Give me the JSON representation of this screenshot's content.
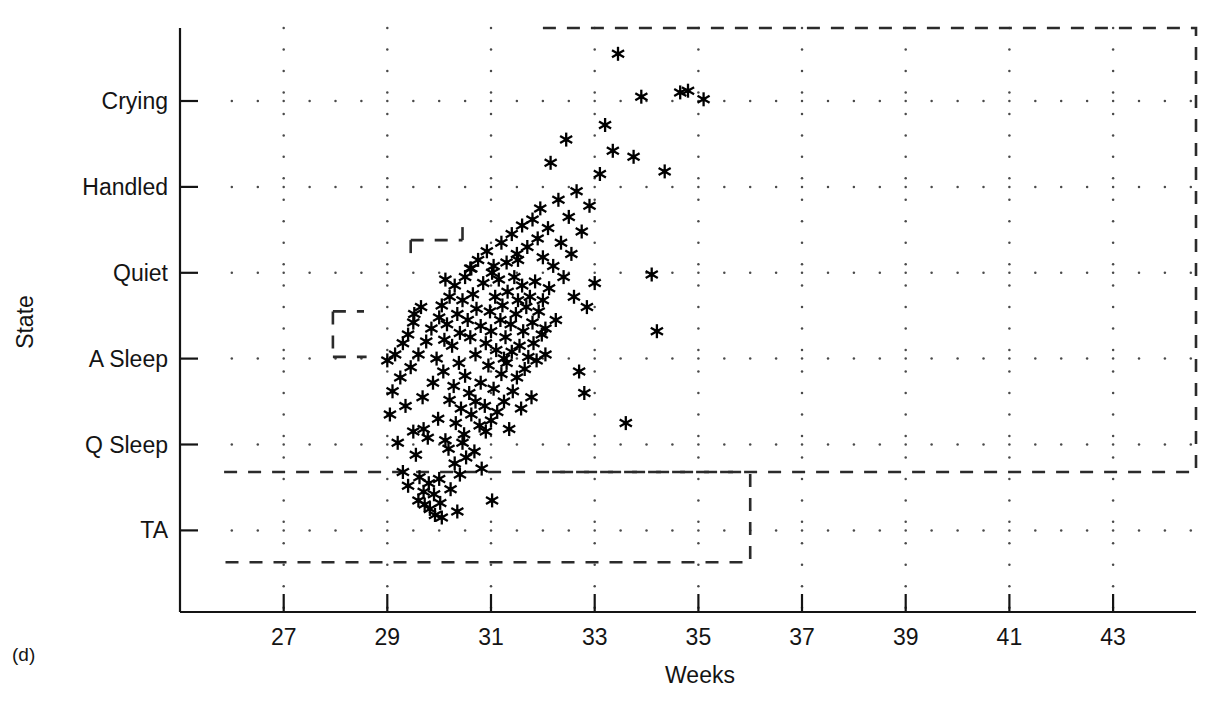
{
  "figure": {
    "panel_label": "(d)",
    "background_color": "#ffffff",
    "ink_color": "#141414"
  },
  "chart_data": {
    "type": "scatter",
    "title": "",
    "subtitle": "",
    "xlabel": "Weeks",
    "ylabel": "State",
    "xlim": [
      25,
      44.6
    ],
    "ylim": [
      -0.95,
      5.85
    ],
    "xticks": [
      27,
      29,
      31,
      33,
      35,
      37,
      39,
      41,
      43
    ],
    "xtick_labels": [
      "27",
      "29",
      "31",
      "33",
      "35",
      "37",
      "39",
      "41",
      "43"
    ],
    "yticks": [
      0,
      1,
      2,
      3,
      4,
      5
    ],
    "ytick_labels": [
      "TA",
      "Q Sleep",
      "A Sleep",
      "Quiet",
      "Handled",
      "Crying"
    ],
    "y_category_order_bottom_to_top": [
      "TA",
      "Q Sleep",
      "A Sleep",
      "Quiet",
      "Handled",
      "Crying"
    ],
    "grid": true,
    "grid_style": "dotted-lattice",
    "legend": null,
    "marker": "asterisk",
    "marker_color": "#000000",
    "points": [
      [
        29.05,
        1.35
      ],
      [
        29.1,
        1.62
      ],
      [
        29.15,
        2.05
      ],
      [
        29.2,
        1.02
      ],
      [
        29.25,
        1.78
      ],
      [
        29.3,
        2.18
      ],
      [
        29.3,
        0.68
      ],
      [
        29.35,
        1.45
      ],
      [
        29.4,
        2.28
      ],
      [
        29.4,
        0.52
      ],
      [
        29.45,
        1.9
      ],
      [
        29.5,
        2.42
      ],
      [
        29.5,
        1.15
      ],
      [
        29.55,
        0.88
      ],
      [
        29.6,
        2.05
      ],
      [
        29.6,
        0.35
      ],
      [
        29.62,
        0.62
      ],
      [
        29.65,
        2.6
      ],
      [
        29.68,
        1.55
      ],
      [
        29.7,
        0.45
      ],
      [
        29.72,
        0.3
      ],
      [
        29.75,
        2.2
      ],
      [
        29.78,
        1.08
      ],
      [
        29.8,
        0.55
      ],
      [
        29.82,
        0.25
      ],
      [
        29.85,
        2.35
      ],
      [
        29.88,
        1.72
      ],
      [
        29.9,
        0.42
      ],
      [
        29.92,
        0.18
      ],
      [
        29.95,
        2.0
      ],
      [
        29.98,
        1.3
      ],
      [
        30.0,
        2.48
      ],
      [
        30.0,
        0.6
      ],
      [
        30.02,
        0.32
      ],
      [
        30.05,
        2.62
      ],
      [
        30.08,
        1.85
      ],
      [
        30.1,
        2.22
      ],
      [
        30.12,
        1.05
      ],
      [
        30.15,
        2.4
      ],
      [
        30.18,
        0.95
      ],
      [
        30.2,
        2.72
      ],
      [
        30.2,
        1.52
      ],
      [
        30.22,
        0.48
      ],
      [
        30.25,
        2.15
      ],
      [
        30.28,
        1.68
      ],
      [
        30.3,
        2.85
      ],
      [
        30.3,
        0.78
      ],
      [
        30.32,
        1.25
      ],
      [
        30.35,
        2.52
      ],
      [
        30.38,
        1.95
      ],
      [
        30.4,
        2.3
      ],
      [
        30.4,
        0.65
      ],
      [
        30.42,
        1.42
      ],
      [
        30.45,
        2.68
      ],
      [
        30.48,
        1.12
      ],
      [
        30.5,
        2.95
      ],
      [
        30.5,
        1.8
      ],
      [
        30.52,
        0.85
      ],
      [
        30.55,
        2.45
      ],
      [
        30.58,
        1.6
      ],
      [
        30.6,
        3.05
      ],
      [
        30.6,
        2.25
      ],
      [
        30.62,
        1.35
      ],
      [
        30.65,
        2.75
      ],
      [
        30.68,
        0.92
      ],
      [
        30.7,
        2.05
      ],
      [
        30.7,
        1.5
      ],
      [
        30.72,
        2.58
      ],
      [
        30.75,
        3.15
      ],
      [
        30.78,
        1.22
      ],
      [
        30.8,
        2.38
      ],
      [
        30.8,
        1.72
      ],
      [
        30.82,
        0.72
      ],
      [
        30.85,
        2.88
      ],
      [
        30.88,
        1.45
      ],
      [
        30.9,
        2.18
      ],
      [
        30.92,
        3.25
      ],
      [
        30.95,
        1.92
      ],
      [
        30.98,
        2.55
      ],
      [
        31.0,
        1.28
      ],
      [
        31.0,
        2.32
      ],
      [
        31.02,
        3.0
      ],
      [
        31.05,
        1.65
      ],
      [
        31.08,
        2.72
      ],
      [
        31.1,
        2.1
      ],
      [
        31.12,
        1.38
      ],
      [
        31.15,
        2.92
      ],
      [
        31.18,
        2.45
      ],
      [
        31.2,
        3.35
      ],
      [
        31.2,
        1.82
      ],
      [
        31.22,
        2.62
      ],
      [
        31.25,
        1.5
      ],
      [
        31.28,
        2.25
      ],
      [
        31.3,
        3.12
      ],
      [
        31.3,
        1.95
      ],
      [
        31.32,
        2.78
      ],
      [
        31.35,
        1.18
      ],
      [
        31.38,
        2.4
      ],
      [
        31.4,
        3.45
      ],
      [
        31.4,
        2.08
      ],
      [
        31.42,
        1.62
      ],
      [
        31.45,
        2.95
      ],
      [
        31.48,
        2.52
      ],
      [
        31.5,
        3.22
      ],
      [
        31.5,
        1.78
      ],
      [
        31.52,
        2.68
      ],
      [
        31.55,
        2.15
      ],
      [
        31.58,
        1.42
      ],
      [
        31.6,
        3.55
      ],
      [
        31.6,
        2.85
      ],
      [
        31.62,
        2.32
      ],
      [
        31.65,
        1.88
      ],
      [
        31.68,
        2.6
      ],
      [
        31.7,
        3.3
      ],
      [
        31.72,
        2.02
      ],
      [
        31.75,
        2.72
      ],
      [
        31.78,
        1.55
      ],
      [
        31.8,
        3.62
      ],
      [
        31.8,
        2.42
      ],
      [
        31.82,
        2.18
      ],
      [
        31.85,
        2.9
      ],
      [
        31.88,
        1.98
      ],
      [
        31.9,
        3.4
      ],
      [
        31.92,
        2.55
      ],
      [
        31.95,
        3.75
      ],
      [
        31.98,
        2.28
      ],
      [
        32.0,
        3.18
      ],
      [
        32.0,
        2.68
      ],
      [
        32.05,
        2.05
      ],
      [
        32.1,
        3.52
      ],
      [
        32.12,
        2.82
      ],
      [
        32.15,
        4.28
      ],
      [
        32.2,
        3.08
      ],
      [
        32.25,
        2.45
      ],
      [
        32.3,
        3.85
      ],
      [
        32.35,
        3.35
      ],
      [
        32.4,
        2.95
      ],
      [
        32.45,
        4.55
      ],
      [
        32.5,
        3.65
      ],
      [
        32.55,
        3.22
      ],
      [
        32.6,
        2.72
      ],
      [
        32.65,
        3.95
      ],
      [
        32.7,
        1.85
      ],
      [
        32.75,
        3.48
      ],
      [
        32.8,
        1.6
      ],
      [
        32.85,
        2.6
      ],
      [
        32.9,
        3.78
      ],
      [
        33.0,
        2.88
      ],
      [
        33.1,
        4.15
      ],
      [
        33.2,
        4.72
      ],
      [
        33.35,
        4.42
      ],
      [
        33.45,
        5.55
      ],
      [
        33.6,
        1.25
      ],
      [
        33.75,
        4.35
      ],
      [
        33.9,
        5.05
      ],
      [
        34.1,
        2.98
      ],
      [
        34.2,
        2.32
      ],
      [
        34.35,
        4.18
      ],
      [
        34.65,
        5.1
      ],
      [
        34.8,
        5.12
      ],
      [
        35.1,
        5.02
      ],
      [
        29.0,
        1.98
      ],
      [
        29.52,
        2.52
      ],
      [
        30.12,
        2.92
      ],
      [
        30.62,
        3.05
      ],
      [
        31.05,
        3.08
      ],
      [
        31.52,
        3.15
      ],
      [
        31.02,
        0.35
      ],
      [
        30.35,
        0.22
      ],
      [
        30.05,
        0.15
      ],
      [
        29.7,
        1.18
      ],
      [
        31.25,
        2.0
      ],
      [
        32.05,
        2.35
      ],
      [
        30.9,
        1.15
      ],
      [
        30.45,
        1.02
      ]
    ],
    "dashed_regions": [
      {
        "name": "upper-right-region",
        "description": "Upper dashed boundary enclosing the high-state / later-weeks area",
        "path_weeks_state": [
          [
            32.0,
            5.85
          ],
          [
            44.6,
            5.85
          ],
          [
            44.6,
            0.68
          ],
          [
            32.0,
            0.68
          ]
        ]
      },
      {
        "name": "lower-left-region",
        "description": "Lower dashed boundary enclosing the TA / early-weeks area",
        "path_weeks_state": [
          [
            25.85,
            0.68
          ],
          [
            36.0,
            0.68
          ],
          [
            36.0,
            -0.37
          ],
          [
            25.85,
            -0.37
          ]
        ]
      },
      {
        "name": "mid-staircase",
        "description": "Short dashed staircase segments inside the main cluster",
        "segments_weeks_state": [
          [
            [
              27.95,
              2.55
            ],
            [
              28.55,
              2.55
            ]
          ],
          [
            [
              27.95,
              2.55
            ],
            [
              27.95,
              2.02
            ]
          ],
          [
            [
              27.95,
              2.02
            ],
            [
              28.6,
              2.02
            ]
          ],
          [
            [
              29.45,
              3.38
            ],
            [
              30.45,
              3.38
            ]
          ],
          [
            [
              29.45,
              3.38
            ],
            [
              29.45,
              3.15
            ]
          ],
          [
            [
              30.45,
              3.38
            ],
            [
              30.45,
              3.62
            ]
          ]
        ]
      }
    ]
  }
}
